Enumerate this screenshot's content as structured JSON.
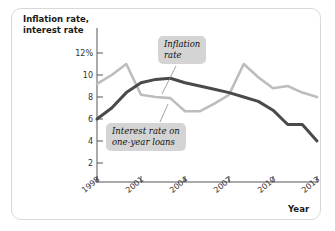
{
  "chart_data": {
    "type": "line",
    "title": "",
    "xlabel": "Year",
    "ylabel": "Inflation rate, interest rate",
    "xlim": [
      1998,
      2013
    ],
    "ylim": [
      0,
      12
    ],
    "grid": false,
    "legend_position": "inline-callouts",
    "x": [
      1998,
      1999,
      2000,
      2001,
      2002,
      2003,
      2004,
      2005,
      2006,
      2007,
      2008,
      2009,
      2010,
      2011,
      2012,
      2013
    ],
    "xticks": [
      "1998",
      "2001",
      "2004",
      "2007",
      "2010",
      "2013"
    ],
    "yticks": [
      "12%",
      "10",
      "8",
      "6",
      "4",
      "2"
    ],
    "ytick_values": [
      12,
      10,
      8,
      6,
      4,
      2
    ],
    "series": [
      {
        "name": "Inflation rate",
        "color": "#bdbdbd",
        "values": [
          9.2,
          10.0,
          11.0,
          8.2,
          8.0,
          7.9,
          6.7,
          6.7,
          7.4,
          8.2,
          11.0,
          9.8,
          8.8,
          9.0,
          8.4,
          8.0
        ]
      },
      {
        "name": "Interest rate on one-year loans",
        "color": "#4a4a4a",
        "values": [
          6.0,
          7.0,
          8.4,
          9.3,
          9.6,
          9.7,
          9.3,
          9.0,
          8.7,
          8.4,
          8.0,
          7.6,
          6.8,
          5.5,
          5.5,
          4.0
        ]
      }
    ],
    "annotations": [
      {
        "id": "inflation-callout",
        "text": "Inflation\nrate",
        "points_to_series": "Inflation rate"
      },
      {
        "id": "interest-callout",
        "text": "Interest rate on\none-year loans",
        "points_to_series": "Interest rate on one-year loans"
      }
    ]
  },
  "axes": {
    "y_title": "Inflation rate,\ninterest rate",
    "x_title": "Year"
  },
  "ticks": {
    "y": [
      {
        "label": "12%",
        "top": 49
      },
      {
        "label": "10",
        "top": 71
      },
      {
        "label": "8",
        "top": 93
      },
      {
        "label": "6",
        "top": 115
      },
      {
        "label": "4",
        "top": 137
      },
      {
        "label": "2",
        "top": 159
      }
    ],
    "x": [
      {
        "label": "1998",
        "left": 79
      },
      {
        "label": "2001",
        "left": 124
      },
      {
        "label": "2004",
        "left": 169
      },
      {
        "label": "2007",
        "left": 214
      },
      {
        "label": "2010",
        "left": 259
      },
      {
        "label": "2013",
        "left": 304
      }
    ]
  },
  "callouts": {
    "inflation": "Inflation\nrate",
    "interest": "Interest rate on\none-year loans"
  },
  "colors": {
    "inflation_line": "#bdbdbd",
    "interest_line": "#4a4a4a",
    "callout_bg": "#d4d4d4",
    "axis": "#555555",
    "frame": "#d8d8d8"
  }
}
